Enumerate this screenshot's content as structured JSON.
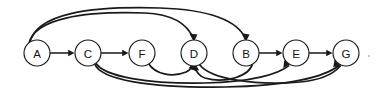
{
  "figure": {
    "background_color": "#ffffff",
    "stroke_color": "#1a1a1a",
    "node_fill_color": "#ffffff",
    "width": 376,
    "height": 93
  },
  "graph": {
    "type": "directed-graph",
    "node_radius": 13,
    "nodes": [
      {
        "id": "A",
        "label": "A",
        "cx": 37,
        "cy": 53
      },
      {
        "id": "C",
        "label": "C",
        "cx": 88,
        "cy": 53
      },
      {
        "id": "F",
        "label": "F",
        "cx": 142,
        "cy": 53
      },
      {
        "id": "D",
        "label": "D",
        "cx": 194,
        "cy": 53
      },
      {
        "id": "B",
        "label": "B",
        "cx": 246,
        "cy": 53
      },
      {
        "id": "E",
        "label": "E",
        "cx": 296,
        "cy": 53
      },
      {
        "id": "G",
        "label": "G",
        "cx": 346,
        "cy": 53
      }
    ],
    "edges": [
      {
        "from": "A",
        "to": "C",
        "shape": "straight",
        "side": "middle"
      },
      {
        "from": "C",
        "to": "F",
        "shape": "straight",
        "side": "middle"
      },
      {
        "from": "B",
        "to": "E",
        "shape": "straight",
        "side": "middle"
      },
      {
        "from": "E",
        "to": "G",
        "shape": "straight",
        "side": "middle"
      },
      {
        "from": "A",
        "to": "D",
        "shape": "arc",
        "side": "top"
      },
      {
        "from": "A",
        "to": "B",
        "shape": "arc",
        "side": "top"
      },
      {
        "from": "C",
        "to": "E",
        "shape": "arc",
        "side": "bottom"
      },
      {
        "from": "C",
        "to": "G",
        "shape": "arc",
        "side": "bottom"
      },
      {
        "from": "F",
        "to": "D",
        "shape": "arc",
        "side": "bottom"
      },
      {
        "from": "D",
        "to": "G",
        "shape": "arc",
        "side": "bottom"
      },
      {
        "from": "B",
        "to": "D",
        "shape": "arc",
        "side": "bottom"
      }
    ]
  }
}
